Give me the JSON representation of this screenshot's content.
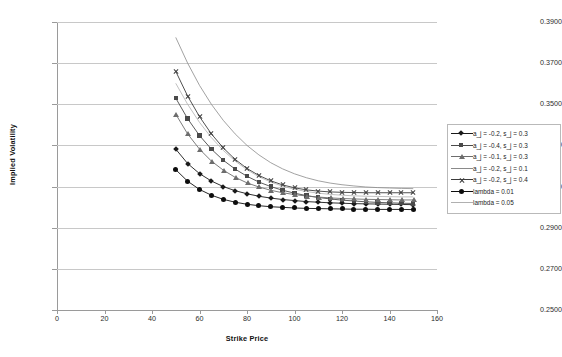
{
  "chart_data": {
    "type": "line",
    "title": "",
    "xlabel": "Strike Price",
    "ylabel": "Implied Volatility",
    "xlim": [
      0,
      160
    ],
    "ylim": [
      0.25,
      0.39
    ],
    "xticks": [
      0,
      20,
      40,
      60,
      80,
      100,
      120,
      140,
      160
    ],
    "xtick_labels": [
      "0",
      "20",
      "40",
      "60",
      "80",
      "100",
      "120",
      "140",
      "160"
    ],
    "yticks": [
      0.25,
      0.27,
      0.29,
      0.31,
      0.33,
      0.35,
      0.37,
      0.39
    ],
    "ytick_labels": [
      "0.2500",
      "0.2700",
      "0.2900",
      "0.3100",
      "0.3300",
      "0.3500",
      "0.3700",
      "0.3900"
    ],
    "grid": "horizontal",
    "legend_position": "right",
    "x": [
      50,
      55,
      60,
      65,
      70,
      75,
      80,
      85,
      90,
      95,
      100,
      105,
      110,
      115,
      120,
      125,
      130,
      135,
      140,
      145,
      150
    ],
    "series": [
      {
        "name": "a_j = -0.2, s_j = 0.3",
        "marker": "diamond",
        "color": "#1a1a1a",
        "values": [
          0.3282,
          0.3212,
          0.3163,
          0.3127,
          0.31,
          0.308,
          0.3065,
          0.3053,
          0.3044,
          0.3037,
          0.3032,
          0.3027,
          0.3024,
          0.3021,
          0.3019,
          0.3017,
          0.3016,
          0.3015,
          0.3014,
          0.3013,
          0.3012
        ]
      },
      {
        "name": "a_j = -0.4, s_j = 0.3",
        "marker": "square",
        "color": "#4a4a4a",
        "values": [
          0.353,
          0.343,
          0.3348,
          0.3282,
          0.3228,
          0.3185,
          0.315,
          0.3122,
          0.31,
          0.3082,
          0.3068,
          0.3056,
          0.3047,
          0.304,
          0.3034,
          0.303,
          0.3026,
          0.3023,
          0.3021,
          0.3019,
          0.3018
        ]
      },
      {
        "name": "a_j = -0.1, s_j = 0.3",
        "marker": "triangle",
        "color": "#6d6d6d",
        "values": [
          0.3452,
          0.3356,
          0.3282,
          0.3224,
          0.318,
          0.3145,
          0.3118,
          0.3098,
          0.3082,
          0.307,
          0.3061,
          0.3054,
          0.3049,
          0.3045,
          0.3042,
          0.304,
          0.3038,
          0.3037,
          0.3036,
          0.3035,
          0.3035
        ]
      },
      {
        "name": "a_j = -0.2, s_j = 0.1",
        "marker": "none",
        "color": "#8a8a8a",
        "values": [
          0.3825,
          0.37,
          0.3592,
          0.35,
          0.3422,
          0.3356,
          0.33,
          0.3254,
          0.3216,
          0.3186,
          0.3162,
          0.3143,
          0.3128,
          0.3117,
          0.3109,
          0.3103,
          0.3098,
          0.3095,
          0.3093,
          0.3091,
          0.309
        ]
      },
      {
        "name": "a_j = -0.2, s_j = 0.4",
        "marker": "x",
        "color": "#3c3c3c",
        "values": [
          0.366,
          0.354,
          0.344,
          0.3356,
          0.3288,
          0.3232,
          0.3188,
          0.3154,
          0.3128,
          0.3108,
          0.3094,
          0.3084,
          0.3078,
          0.3074,
          0.3072,
          0.3071,
          0.307,
          0.307,
          0.307,
          0.307,
          0.307
        ]
      },
      {
        "name": "lambda = 0.01",
        "marker": "circle",
        "color": "#0d0d0d",
        "values": [
          0.3182,
          0.3126,
          0.3086,
          0.3058,
          0.3038,
          0.3024,
          0.3014,
          0.3007,
          0.3002,
          0.2999,
          0.2996,
          0.2994,
          0.2993,
          0.2992,
          0.2991,
          0.299,
          0.299,
          0.2989,
          0.2989,
          0.2989,
          0.2988
        ]
      },
      {
        "name": "lambda = 0.05",
        "marker": "none",
        "color": "#b0b0b0",
        "values": [
          0.3602,
          0.35,
          0.3412,
          0.3338,
          0.3276,
          0.3224,
          0.3182,
          0.3148,
          0.3122,
          0.3102,
          0.3087,
          0.3076,
          0.3068,
          0.3062,
          0.3058,
          0.3055,
          0.3053,
          0.3052,
          0.3051,
          0.305,
          0.305
        ]
      }
    ]
  }
}
